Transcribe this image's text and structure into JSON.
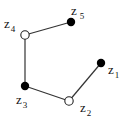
{
  "diagram": {
    "type": "polyline-graph",
    "colors": {
      "line": "#333333",
      "filled": "#000000",
      "open_fill": "#ffffff",
      "open_stroke": "#222222"
    },
    "nodes": [
      {
        "id": "z1",
        "letter": "z",
        "sub": "1",
        "x": 101,
        "y": 63,
        "style": "filled"
      },
      {
        "id": "z2",
        "letter": "z",
        "sub": "2",
        "x": 69,
        "y": 101,
        "style": "open"
      },
      {
        "id": "z3",
        "letter": "z",
        "sub": "3",
        "x": 25,
        "y": 86,
        "style": "filled"
      },
      {
        "id": "z4",
        "letter": "z",
        "sub": "4",
        "x": 25,
        "y": 35,
        "style": "open"
      },
      {
        "id": "z5",
        "letter": "z",
        "sub": "5",
        "x": 71,
        "y": 22,
        "style": "filled"
      }
    ],
    "edges": [
      [
        "z1",
        "z2"
      ],
      [
        "z2",
        "z3"
      ],
      [
        "z3",
        "z4"
      ],
      [
        "z4",
        "z5"
      ]
    ]
  }
}
